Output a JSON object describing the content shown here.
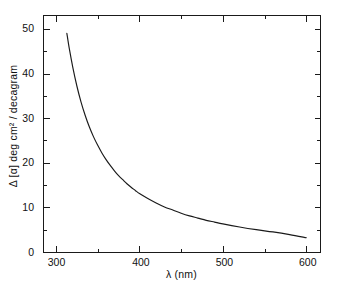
{
  "chart_data": {
    "type": "line",
    "title": "",
    "subtitle": "",
    "xlabel": "λ (nm)",
    "ylabel": "Δ [α] deg cm² / decagram",
    "xlim": [
      285,
      617
    ],
    "ylim": [
      0,
      53
    ],
    "grid": false,
    "legend": null,
    "annotations": [],
    "x_major_ticks": [
      300,
      400,
      500,
      600
    ],
    "x_major_tick_labels": [
      "300",
      "400",
      "500",
      "600"
    ],
    "x_minor_ticks": [
      350,
      450,
      550
    ],
    "y_major_ticks": [
      0,
      10,
      20,
      30,
      40,
      50
    ],
    "y_major_tick_labels": [
      "0",
      "10",
      "20",
      "30",
      "40",
      "50"
    ],
    "y_minor_ticks": [
      5,
      15,
      25,
      35,
      45
    ],
    "series": [
      {
        "name": "delta-alpha-dispersion",
        "color": "#1a1a1a",
        "x": [
          313,
          316,
          320,
          325,
          330,
          335,
          340,
          345,
          350,
          355,
          360,
          365,
          370,
          375,
          380,
          385,
          390,
          395,
          400,
          410,
          420,
          430,
          440,
          450,
          460,
          470,
          480,
          490,
          500,
          520,
          540,
          560,
          580,
          600
        ],
        "y": [
          49.0,
          45.5,
          41.5,
          37.2,
          33.6,
          30.6,
          28.0,
          25.8,
          23.9,
          22.2,
          20.7,
          19.4,
          18.2,
          17.1,
          16.2,
          15.3,
          14.5,
          13.8,
          13.1,
          12.0,
          11.0,
          10.1,
          9.4,
          8.7,
          8.1,
          7.6,
          7.1,
          6.7,
          6.3,
          5.6,
          5.0,
          4.5,
          3.9,
          3.2
        ]
      }
    ]
  },
  "axes": {
    "x_axis_name": "wavelength-axis",
    "y_axis_name": "delta-specific-rotation-axis"
  }
}
